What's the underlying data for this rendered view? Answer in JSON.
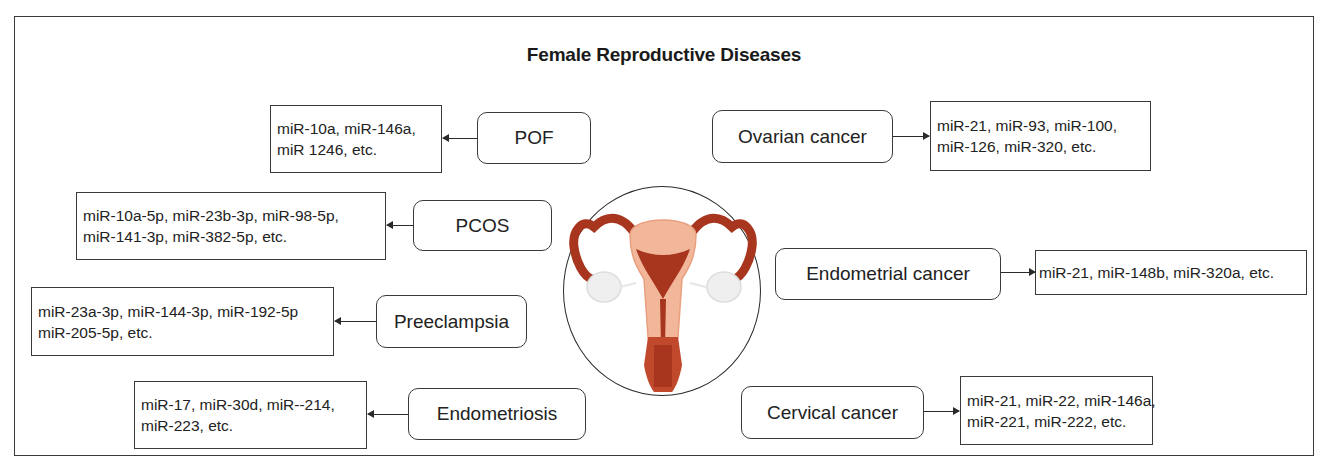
{
  "title": "Female Reproductive Diseases",
  "center_illustration": {
    "icon": "uterus-icon",
    "colors": {
      "tissue": "#f2b79a",
      "muscle": "#a8361f",
      "ovary": "#eeeeee"
    }
  },
  "left_diseases": [
    {
      "name": "POF",
      "mirnas": [
        "miR-10a, miR-146a,",
        "miR 1246, etc."
      ]
    },
    {
      "name": "PCOS",
      "mirnas": [
        "miR-10a-5p, miR-23b-3p, miR-98-5p,",
        "miR-141-3p, miR-382-5p, etc."
      ]
    },
    {
      "name": "Preeclampsia",
      "mirnas": [
        "miR-23a-3p, miR-144-3p, miR-192-5p",
        "miR-205-5p, etc."
      ]
    },
    {
      "name": "Endometriosis",
      "mirnas": [
        "miR-17, miR-30d, miR--214,",
        "miR-223, etc."
      ]
    }
  ],
  "right_diseases": [
    {
      "name": "Ovarian cancer",
      "mirnas": [
        "miR-21, miR-93, miR-100,",
        "miR-126, miR-320, etc."
      ]
    },
    {
      "name": "Endometrial cancer",
      "mirnas": [
        "miR-21, miR-148b, miR-320a, etc."
      ]
    },
    {
      "name": "Cervical cancer",
      "mirnas": [
        "miR-21, miR-22, miR-146a,",
        "miR-221, miR-222, etc."
      ]
    }
  ]
}
